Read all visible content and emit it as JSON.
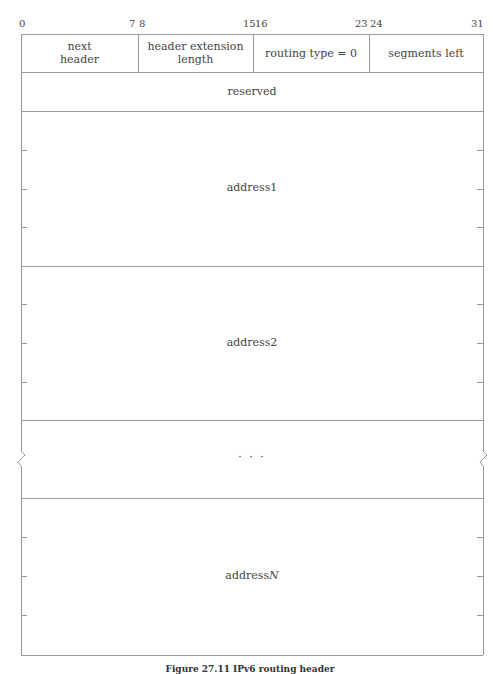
{
  "bit_positions": [
    "0",
    "7",
    "8",
    "15",
    "16",
    "23",
    "24",
    "31"
  ],
  "row1_fields": [
    {
      "label": "next\nheader",
      "line1": "next",
      "line2": "header"
    },
    {
      "label": "header extension length",
      "line1": "header extension",
      "line2": "length"
    },
    {
      "label": "routing type = 0"
    },
    {
      "label": "segments left"
    }
  ],
  "reserved": "reserved",
  "address1": "address1",
  "address2": "address2",
  "ellipsis": "· · ·",
  "addressN_prefix": "address",
  "addressN_suffix": "N",
  "caption": "Figure 27.11 IPv6 routing header",
  "colors": {
    "line": "#999999",
    "text": "#444444",
    "background": "#ffffff"
  }
}
